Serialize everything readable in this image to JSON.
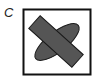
{
  "panel": {
    "label": "C",
    "frame_color": "#111111",
    "shape_fill": "#555555",
    "shape_stroke": "#1a1a1a",
    "shapes": [
      {
        "type": "ellipse",
        "description": "rotated ellipse, lower-left to upper-right"
      },
      {
        "type": "rectangle",
        "description": "rotated bar, upper-left to lower-right, overlapping ellipse"
      }
    ]
  }
}
